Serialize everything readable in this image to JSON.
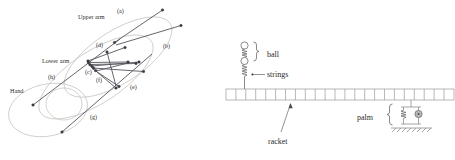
{
  "figure": {
    "title": "",
    "background_color": "#ffffff",
    "panels": [
      {
        "id": "left-panel",
        "name": "arm-motion-diagram",
        "description": "Stick-figure arm segments over successive time instants with labelled elliptical regions",
        "labels": {
          "upper_arm": "Upper arm",
          "lower_arm": "Lower arm",
          "hand": "Hand"
        },
        "tags": [
          {
            "id": "a",
            "text": "(a)",
            "x": 117,
            "y": 13
          },
          {
            "id": "b",
            "text": "(b)",
            "x": 163,
            "y": 48
          },
          {
            "id": "c",
            "text": "(c)",
            "x": 85,
            "y": 74
          },
          {
            "id": "d",
            "text": "(d)",
            "x": 96,
            "y": 47
          },
          {
            "id": "e",
            "text": "(e)",
            "x": 130,
            "y": 89
          },
          {
            "id": "f",
            "text": "(f)",
            "x": 96,
            "y": 82
          },
          {
            "id": "g",
            "text": "(g)",
            "x": 90,
            "y": 119
          },
          {
            "id": "h",
            "text": "(h)",
            "x": 48,
            "y": 79
          }
        ],
        "colors": {
          "segment": "#55555d",
          "node": "#3a3a42",
          "region_outline": "#cbc8c4",
          "text": "#2b2b2b"
        },
        "segments": [
          {
            "x1": 114.5,
            "y1": 42.5,
            "x2": 162.5,
            "y2": 10.0
          },
          {
            "x1": 116.0,
            "y1": 45.0,
            "x2": 181.0,
            "y2": 25.5
          },
          {
            "x1": 88.0,
            "y1": 61.0,
            "x2": 125.0,
            "y2": 47.5
          },
          {
            "x1": 88.5,
            "y1": 62.5,
            "x2": 128.0,
            "y2": 62.0
          },
          {
            "x1": 90.0,
            "y1": 64.5,
            "x2": 136.0,
            "y2": 63.5
          },
          {
            "x1": 92.0,
            "y1": 66.0,
            "x2": 139.0,
            "y2": 62.0
          },
          {
            "x1": 93.0,
            "y1": 68.0,
            "x2": 143.5,
            "y2": 71.5
          },
          {
            "x1": 95.0,
            "y1": 70.5,
            "x2": 119.0,
            "y2": 86.5
          },
          {
            "x1": 97.0,
            "y1": 72.0,
            "x2": 116.0,
            "y2": 88.0
          },
          {
            "x1": 33.0,
            "y1": 105.0,
            "x2": 120.0,
            "y2": 39.0
          },
          {
            "x1": 62.0,
            "y1": 132.0,
            "x2": 152.0,
            "y2": 54.0
          },
          {
            "x1": 107.0,
            "y1": 52.0,
            "x2": 116.0,
            "y2": 86.0
          },
          {
            "x1": 96.0,
            "y1": 71.0,
            "x2": 130.0,
            "y2": 62.5
          }
        ],
        "nodes": [
          {
            "x": 162.5,
            "y": 10.0
          },
          {
            "x": 181.0,
            "y": 25.5
          },
          {
            "x": 114.5,
            "y": 42.5
          },
          {
            "x": 125.0,
            "y": 47.5
          },
          {
            "x": 107.0,
            "y": 52.0
          },
          {
            "x": 88.0,
            "y": 61.0
          },
          {
            "x": 88.5,
            "y": 62.5
          },
          {
            "x": 90.0,
            "y": 64.5
          },
          {
            "x": 92.0,
            "y": 66.0
          },
          {
            "x": 93.0,
            "y": 68.0
          },
          {
            "x": 95.0,
            "y": 70.5
          },
          {
            "x": 128.0,
            "y": 62.0
          },
          {
            "x": 136.0,
            "y": 63.5
          },
          {
            "x": 139.0,
            "y": 62.0
          },
          {
            "x": 143.5,
            "y": 71.5
          },
          {
            "x": 119.0,
            "y": 86.5
          },
          {
            "x": 116.0,
            "y": 88.0
          },
          {
            "x": 33.0,
            "y": 105.0
          },
          {
            "x": 62.0,
            "y": 132.0
          }
        ],
        "regions": [
          {
            "id": "outer-upper",
            "cx": 118,
            "cy": 57,
            "rx": 62,
            "ry": 26,
            "rotation": -33
          },
          {
            "id": "outer-lower",
            "cx": 96,
            "cy": 77,
            "rx": 66,
            "ry": 26,
            "rotation": -33
          },
          {
            "id": "hand-region",
            "cx": 48,
            "cy": 110,
            "rx": 40,
            "ry": 26,
            "rotation": -12
          },
          {
            "id": "hand-inner",
            "cx": 64,
            "cy": 104,
            "rx": 18,
            "ry": 16,
            "rotation": 0
          }
        ]
      },
      {
        "id": "right-panel",
        "name": "racket-ball-model-diagram",
        "description": "Lumped-parameter model: ball masses with spring strings impacting a segmented racket held by a palm spring-damper on ground",
        "labels": {
          "ball": "ball",
          "strings": "strings",
          "racket": "racket",
          "palm": "palm"
        },
        "racket": {
          "cells": 23,
          "x": 226,
          "y": 89,
          "width": 228,
          "height": 11
        },
        "colors": {
          "outline": "#8e8e8e",
          "racket": "#9a9a9a",
          "damper": "#b9b9b9",
          "text": "#2b2b2b"
        }
      }
    ]
  }
}
